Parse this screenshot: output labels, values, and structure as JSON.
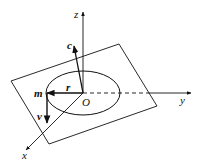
{
  "diagram": {
    "type": "3d-coordinate-figure",
    "labels": {
      "z_axis": "z",
      "y_axis": "y",
      "x_axis": "x",
      "origin": "O",
      "angular_momentum": "c",
      "position_vector": "r",
      "mass": "m",
      "velocity": "v"
    },
    "colors": {
      "stroke": "#111111",
      "background": "#ffffff"
    }
  }
}
